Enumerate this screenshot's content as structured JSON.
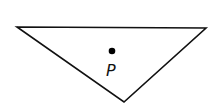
{
  "diagram": {
    "shape": "triangle",
    "vertices": [
      [
        17,
        27
      ],
      [
        206,
        28
      ],
      [
        124,
        102
      ]
    ],
    "stroke_color": "#111111",
    "fill_color": "#ffffff",
    "point": {
      "label": "P",
      "x": 112,
      "y": 51,
      "color": "#000000"
    }
  }
}
